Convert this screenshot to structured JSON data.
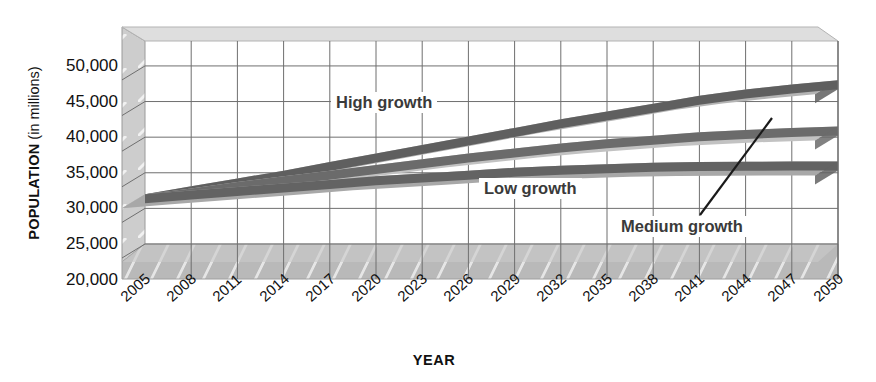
{
  "chart_data": {
    "type": "area",
    "title": "",
    "subtitle": "",
    "xlabel": "YEAR",
    "ylabel_strong": "POPULATION",
    "ylabel_light": " (in millions)",
    "ylabel_full": "POPULATION (in millions)",
    "grid": true,
    "legend_position": "inline-callouts",
    "style": "3d-ribbon",
    "categories": [
      2005,
      2008,
      2011,
      2014,
      2017,
      2020,
      2023,
      2026,
      2029,
      2032,
      2035,
      2038,
      2041,
      2044,
      2047,
      2050
    ],
    "xtick_labels": [
      "2005",
      "2008",
      "2011",
      "2014",
      "2017",
      "2020",
      "2023",
      "2026",
      "2029",
      "2032",
      "2035",
      "2038",
      "2041",
      "2044",
      "2047",
      "2050"
    ],
    "ytick_labels": [
      "50,000",
      "45,000",
      "40,000",
      "35,000",
      "30,000",
      "25,000",
      "20,000"
    ],
    "ytick_values": [
      50000,
      45000,
      40000,
      35000,
      30000,
      25000,
      20000
    ],
    "ylim": [
      20000,
      53500
    ],
    "xlim": [
      2005,
      2050
    ],
    "series": [
      {
        "name": "High growth",
        "label": "High growth",
        "color": "#b4b4b4",
        "edge_color": "#5f5f5f",
        "values": [
          32000,
          33100,
          34200,
          35300,
          36500,
          37700,
          38900,
          40100,
          41300,
          42500,
          43600,
          44700,
          45800,
          46700,
          47400,
          48000
        ]
      },
      {
        "name": "Medium growth",
        "label": "Medium growth",
        "color": "#c2c2c2",
        "edge_color": "#6b6b6b",
        "values": [
          32000,
          32800,
          33700,
          34500,
          35300,
          36100,
          36900,
          37700,
          38400,
          39100,
          39700,
          40200,
          40700,
          41000,
          41300,
          41500
        ]
      },
      {
        "name": "Low growth",
        "label": "Low growth",
        "color": "#a8a8a8",
        "edge_color": "#636363",
        "values": [
          32000,
          32500,
          33000,
          33500,
          34000,
          34500,
          34900,
          35300,
          35700,
          36000,
          36200,
          36400,
          36500,
          36550,
          36580,
          36600
        ]
      }
    ],
    "annotations": [
      {
        "name": "medium-growth-leader-line",
        "text": "",
        "from": "Medium growth label",
        "to": "medium growth band at ~2044"
      }
    ]
  },
  "axis_titles": {
    "x": "YEAR",
    "y_bold": "POPULATION",
    "y_regular": " (in millions)"
  },
  "colors": {
    "background": "#ffffff",
    "grid": "#6f6f6f",
    "floor": "#b9b9b9",
    "wall": "#cdcdcd",
    "text": "#111111",
    "callout_text": "#3a3a3a"
  }
}
